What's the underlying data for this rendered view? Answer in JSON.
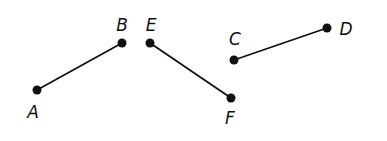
{
  "diagram": {
    "colors": {
      "stroke": "#111111",
      "background": "#ffffff"
    },
    "points": {
      "A": {
        "label": "A",
        "x": 37,
        "y": 90,
        "lx": 33,
        "ly": 112
      },
      "B": {
        "label": "B",
        "x": 122,
        "y": 43,
        "lx": 122,
        "ly": 25
      },
      "E": {
        "label": "E",
        "x": 150,
        "y": 43,
        "lx": 151,
        "ly": 25
      },
      "F": {
        "label": "F",
        "x": 231,
        "y": 98,
        "lx": 230,
        "ly": 118
      },
      "C": {
        "label": "C",
        "x": 234,
        "y": 60,
        "lx": 235,
        "ly": 39
      },
      "D": {
        "label": "D",
        "x": 327,
        "y": 28,
        "lx": 346,
        "ly": 29
      }
    },
    "segments": [
      {
        "name": "AB",
        "from": "A",
        "to": "B"
      },
      {
        "name": "EF",
        "from": "E",
        "to": "F"
      },
      {
        "name": "CD",
        "from": "C",
        "to": "D"
      }
    ]
  }
}
